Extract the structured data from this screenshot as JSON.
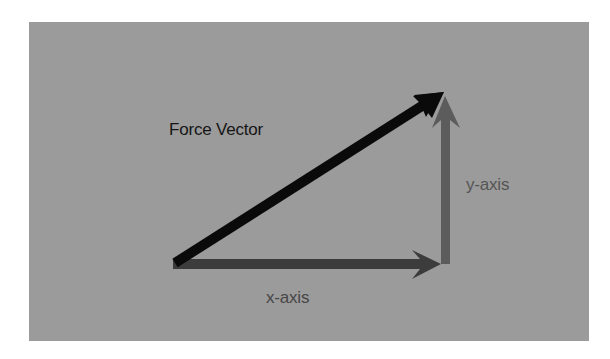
{
  "diagram": {
    "title": "Force Vector",
    "background_color": "#9b9b9b",
    "labels": {
      "force_vector": "Force Vector",
      "y_axis": "y-axis",
      "x_axis": "x-axis"
    },
    "vectors": [
      {
        "name": "force-vector",
        "from": [
          173,
          264
        ],
        "to": [
          444,
          92
        ],
        "color": "#0a0a0a"
      },
      {
        "name": "y-axis-component",
        "from": [
          445,
          264
        ],
        "to": [
          445,
          96
        ],
        "color": "#5c5c5c"
      },
      {
        "name": "x-axis-component",
        "from": [
          173,
          264
        ],
        "to": [
          440,
          264
        ],
        "color": "#3c3c3c"
      }
    ]
  }
}
